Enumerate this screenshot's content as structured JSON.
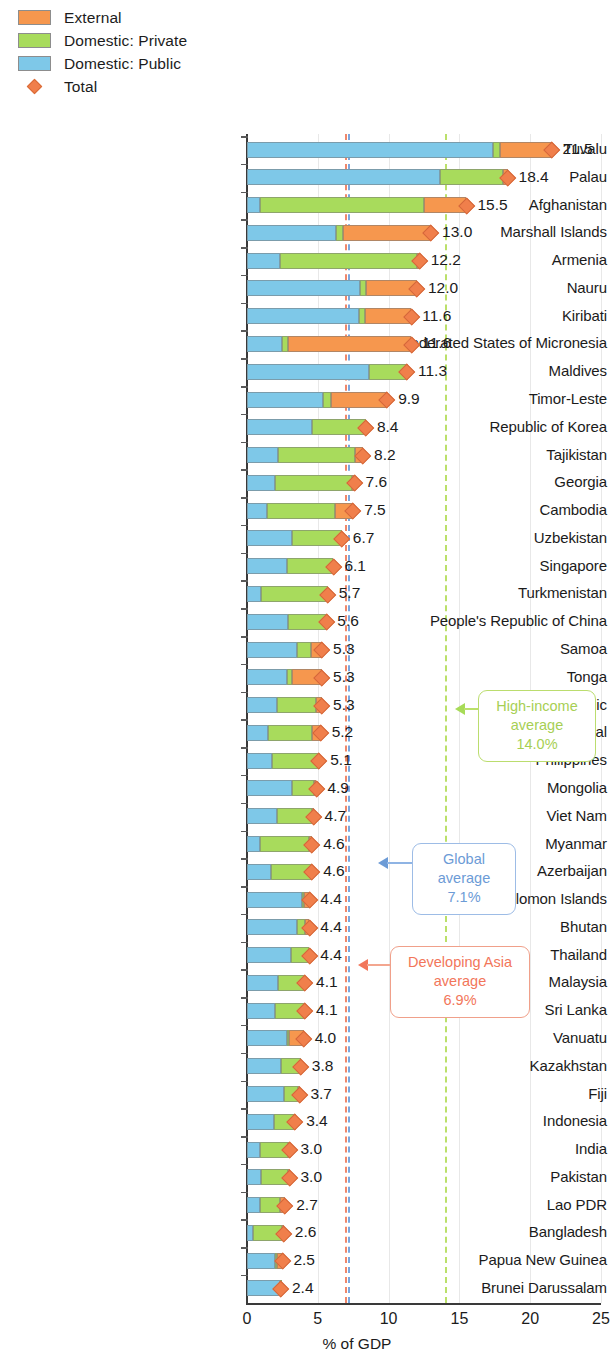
{
  "legend": {
    "items": [
      {
        "label": "External",
        "color": "#F6974E",
        "icon": "square-swatch"
      },
      {
        "label": "Domestic: Private",
        "color": "#A8DB5C",
        "icon": "square-swatch"
      },
      {
        "label": "Domestic: Public",
        "color": "#7EC8E8",
        "icon": "square-swatch"
      },
      {
        "label": "Total",
        "color": "#F07F4B",
        "icon": "diamond-marker"
      }
    ]
  },
  "axis": {
    "xlabel": "% of GDP",
    "xticks": [
      "0",
      "5",
      "10",
      "15",
      "20",
      "25"
    ],
    "xlim": [
      0,
      25
    ]
  },
  "annotations": [
    {
      "id": "high-income",
      "line1": "High-income",
      "line2": "average",
      "value": "14.0%",
      "at": 14.0,
      "color": "#A7CF54"
    },
    {
      "id": "global",
      "line1": "Global average",
      "line2": "",
      "value": "7.1%",
      "at": 7.1,
      "color": "#6C9BD6"
    },
    {
      "id": "developing-asia",
      "line1": "Developing Asia",
      "line2": "average",
      "value": "6.9%",
      "at": 6.9,
      "color": "#F2765A"
    }
  ],
  "chart_data": {
    "type": "bar",
    "title": "",
    "xlabel": "% of GDP",
    "ylabel": "",
    "xlim": [
      0,
      25
    ],
    "grid": true,
    "orientation": "horizontal",
    "stacked": true,
    "legend_position": "top-left",
    "series": [
      {
        "name": "Domestic: Public",
        "color": "#7EC8E8"
      },
      {
        "name": "Domestic: Private",
        "color": "#A8DB5C"
      },
      {
        "name": "External",
        "color": "#F6974E"
      },
      {
        "name": "Total",
        "color": "#F07F4B",
        "marker": "diamond"
      }
    ],
    "categories": [
      "Tuvalu",
      "Palau",
      "Afghanistan",
      "Marshall Islands",
      "Armenia",
      "Nauru",
      "Kiribati",
      "Federated States of Micronesia",
      "Maldives",
      "Timor-Leste",
      "Republic of Korea",
      "Tajikistan",
      "Georgia",
      "Cambodia",
      "Uzbekistan",
      "Singapore",
      "Turkmenistan",
      "People's Republic of China",
      "Samoa",
      "Tonga",
      "Kyrgyz Republic",
      "Nepal",
      "Philippines",
      "Mongolia",
      "Viet Nam",
      "Myanmar",
      "Azerbaijan",
      "Solomon Islands",
      "Bhutan",
      "Thailand",
      "Malaysia",
      "Sri Lanka",
      "Vanuatu",
      "Kazakhstan",
      "Fiji",
      "Indonesia",
      "India",
      "Pakistan",
      "Lao PDR",
      "Bangladesh",
      "Papua New Guinea",
      "Brunei Darussalam"
    ],
    "rows": [
      {
        "name": "Tuvalu",
        "public": 17.4,
        "private": 0.5,
        "external": 3.6,
        "total": "21.5"
      },
      {
        "name": "Palau",
        "public": 13.6,
        "private": 4.5,
        "external": 0.3,
        "total": "18.4"
      },
      {
        "name": "Afghanistan",
        "public": 0.9,
        "private": 11.6,
        "external": 3.0,
        "total": "15.5"
      },
      {
        "name": "Marshall Islands",
        "public": 6.3,
        "private": 0.5,
        "external": 6.2,
        "total": "13.0"
      },
      {
        "name": "Armenia",
        "public": 2.3,
        "private": 9.7,
        "external": 0.2,
        "total": "12.2"
      },
      {
        "name": "Nauru",
        "public": 8.0,
        "private": 0.4,
        "external": 3.6,
        "total": "12.0"
      },
      {
        "name": "Kiribati",
        "public": 7.9,
        "private": 0.4,
        "external": 3.3,
        "total": "11.6"
      },
      {
        "name": "Federated States of Micronesia",
        "public": 2.5,
        "private": 0.4,
        "external": 8.7,
        "total": "11.6"
      },
      {
        "name": "Maldives",
        "public": 8.6,
        "private": 2.6,
        "external": 0.1,
        "total": "11.3"
      },
      {
        "name": "Timor-Leste",
        "public": 5.4,
        "private": 0.5,
        "external": 4.0,
        "total": "9.9"
      },
      {
        "name": "Republic of Korea",
        "public": 4.6,
        "private": 3.8,
        "external": 0.0,
        "total": "8.4"
      },
      {
        "name": "Tajikistan",
        "public": 2.2,
        "private": 5.4,
        "external": 0.6,
        "total": "8.2"
      },
      {
        "name": "Georgia",
        "public": 2.0,
        "private": 5.4,
        "external": 0.2,
        "total": "7.6"
      },
      {
        "name": "Cambodia",
        "public": 1.4,
        "private": 4.8,
        "external": 1.3,
        "total": "7.5"
      },
      {
        "name": "Uzbekistan",
        "public": 3.2,
        "private": 3.5,
        "external": 0.0,
        "total": "6.7"
      },
      {
        "name": "Singapore",
        "public": 2.8,
        "private": 3.3,
        "external": 0.0,
        "total": "6.1"
      },
      {
        "name": "Turkmenistan",
        "public": 1.0,
        "private": 4.7,
        "external": 0.0,
        "total": "5.7"
      },
      {
        "name": "People's Republic of China",
        "public": 2.9,
        "private": 2.7,
        "external": 0.0,
        "total": "5.6"
      },
      {
        "name": "Samoa",
        "public": 3.5,
        "private": 1.0,
        "external": 0.8,
        "total": "5.3"
      },
      {
        "name": "Tonga",
        "public": 2.8,
        "private": 0.4,
        "external": 2.1,
        "total": "5.3"
      },
      {
        "name": "Kyrgyz Republic",
        "public": 2.1,
        "private": 2.8,
        "external": 0.4,
        "total": "5.3"
      },
      {
        "name": "Nepal",
        "public": 1.5,
        "private": 3.1,
        "external": 0.6,
        "total": "5.2"
      },
      {
        "name": "Philippines",
        "public": 1.8,
        "private": 3.2,
        "external": 0.1,
        "total": "5.1"
      },
      {
        "name": "Mongolia",
        "public": 3.2,
        "private": 1.5,
        "external": 0.2,
        "total": "4.9"
      },
      {
        "name": "Viet Nam",
        "public": 2.1,
        "private": 2.5,
        "external": 0.1,
        "total": "4.7"
      },
      {
        "name": "Myanmar",
        "public": 0.9,
        "private": 3.5,
        "external": 0.2,
        "total": "4.6"
      },
      {
        "name": "Azerbaijan",
        "public": 1.7,
        "private": 2.9,
        "external": 0.0,
        "total": "4.6"
      },
      {
        "name": "Solomon Islands",
        "public": 3.9,
        "private": 0.1,
        "external": 0.4,
        "total": "4.4"
      },
      {
        "name": "Bhutan",
        "public": 3.5,
        "private": 0.6,
        "external": 0.3,
        "total": "4.4"
      },
      {
        "name": "Thailand",
        "public": 3.1,
        "private": 1.3,
        "external": 0.0,
        "total": "4.4"
      },
      {
        "name": "Malaysia",
        "public": 2.2,
        "private": 1.9,
        "external": 0.0,
        "total": "4.1"
      },
      {
        "name": "Sri Lanka",
        "public": 2.0,
        "private": 2.1,
        "external": 0.0,
        "total": "4.1"
      },
      {
        "name": "Vanuatu",
        "public": 2.8,
        "private": 0.2,
        "external": 1.0,
        "total": "4.0"
      },
      {
        "name": "Kazakhstan",
        "public": 2.4,
        "private": 1.4,
        "external": 0.0,
        "total": "3.8"
      },
      {
        "name": "Fiji",
        "public": 2.6,
        "private": 1.0,
        "external": 0.1,
        "total": "3.7"
      },
      {
        "name": "Indonesia",
        "public": 1.9,
        "private": 1.4,
        "external": 0.1,
        "total": "3.4"
      },
      {
        "name": "India",
        "public": 0.9,
        "private": 2.0,
        "external": 0.1,
        "total": "3.0"
      },
      {
        "name": "Pakistan",
        "public": 1.0,
        "private": 1.9,
        "external": 0.1,
        "total": "3.0"
      },
      {
        "name": "Lao PDR",
        "public": 0.9,
        "private": 1.4,
        "external": 0.4,
        "total": "2.7"
      },
      {
        "name": "Bangladesh",
        "public": 0.4,
        "private": 2.1,
        "external": 0.1,
        "total": "2.6"
      },
      {
        "name": "Papua New Guinea",
        "public": 2.0,
        "private": 0.1,
        "external": 0.4,
        "total": "2.5"
      },
      {
        "name": "Brunei Darussalam",
        "public": 2.3,
        "private": 0.1,
        "external": 0.0,
        "total": "2.4"
      }
    ]
  }
}
